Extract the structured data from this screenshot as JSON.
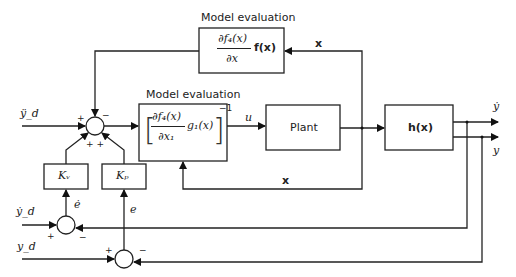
{
  "diagram": {
    "type": "control-block-diagram",
    "blocks": {
      "model_eval_top": {
        "title": "Model evaluation",
        "content": "∂f₄(x)/∂x f(x)",
        "num": "∂f₄(x)",
        "den": "∂x",
        "tail": "f(x)"
      },
      "model_eval_mid": {
        "title": "Model evaluation",
        "content": "[∂f₄(x)/∂x₁ g₁(x)]⁻¹",
        "num": "∂f₄(x)",
        "den": "∂x₁",
        "tail": "g₁(x)",
        "exp": "−1"
      },
      "plant": {
        "label": "Plant"
      },
      "h": {
        "label": "h(x)"
      },
      "kv": {
        "label": "Kᵥ"
      },
      "kp": {
        "label": "Kₚ"
      }
    },
    "signals": {
      "yddd": "ÿ_d",
      "ydd": "ẏ_d",
      "yd": "y_d",
      "u": "u",
      "x_top": "x",
      "x_bottom": "x",
      "edot": "ė",
      "e": "e",
      "ydot_out": "ẏ",
      "y_out": "y"
    },
    "signs": {
      "sum1_plus_left": "+",
      "sum1_minus_top": "−",
      "sum1_plus_bottom": "+ +",
      "sum2_plus": "+",
      "sum2_minus": "−",
      "sum3_plus": "+",
      "sum3_minus": "−"
    }
  }
}
